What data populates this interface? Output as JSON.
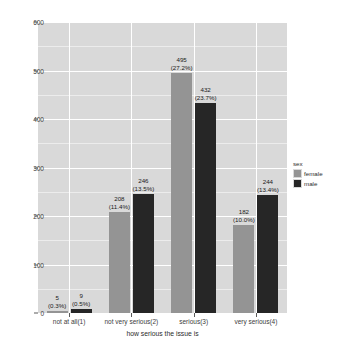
{
  "chart_data": {
    "type": "bar",
    "title": "",
    "subtitle": "",
    "xlabel": "how serious the issue is",
    "ylabel": "",
    "categories": [
      "not at all(1)",
      "not very serious(2)",
      "serious(3)",
      "very serious(4)"
    ],
    "series": [
      {
        "name": "female",
        "color": "#949494",
        "values": [
          5,
          208,
          495,
          182
        ],
        "labels": [
          "5",
          "208",
          "495",
          "182"
        ],
        "percent_labels": [
          "(0.3%)",
          "(11.4%)",
          "(27.2%)",
          "(10.0%)"
        ]
      },
      {
        "name": "male",
        "color": "#262626",
        "values": [
          9,
          246,
          432,
          244
        ],
        "labels": [
          "9",
          "246",
          "432",
          "244"
        ],
        "percent_labels": [
          "(0.5%)",
          "(13.5%)",
          "(23.7%)",
          "(13.4%)"
        ]
      }
    ],
    "ylim": [
      0,
      600
    ],
    "yticks": [
      0,
      100,
      200,
      300,
      400,
      500,
      600
    ],
    "ytick_labels": [
      "0",
      "100",
      "200",
      "300",
      "400",
      "500",
      "600"
    ],
    "grid": true,
    "legend": {
      "title": "sex",
      "position": "right",
      "entries": [
        "female",
        "male"
      ]
    },
    "panel_background": "#d9d9d9",
    "gridline_color": "#ffffff"
  }
}
